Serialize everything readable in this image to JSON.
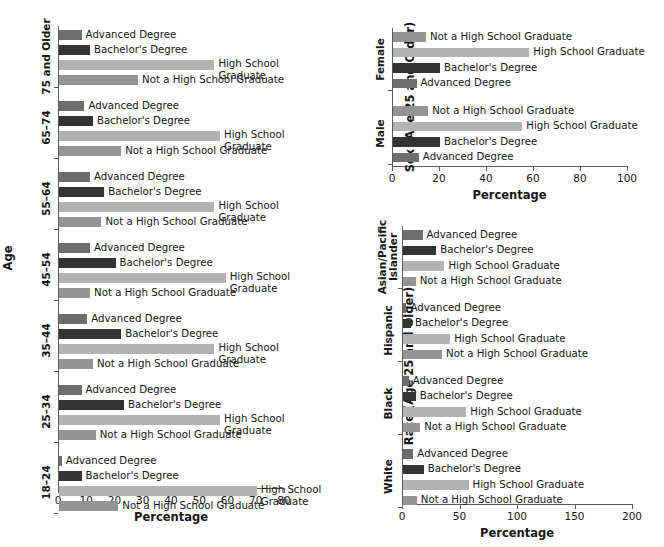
{
  "meta": {
    "categories": [
      "Advanced Degree",
      "Bachelor's Degree",
      "High School Graduate",
      "Not a High School Graduate"
    ],
    "colors": {
      "advanced_degree": "#6e6e6e",
      "bachelors_degree": "#333333",
      "high_school_graduate": "#b3b3b3",
      "not_high_school_graduate": "#949494",
      "axis": "#5a5a5a",
      "text": "#141414",
      "background": "#ffffff"
    },
    "axis_title_x": "Percentage"
  },
  "chart_data": [
    {
      "id": "age-chart",
      "type": "bar",
      "orientation": "horizontal",
      "title": "",
      "xlabel": "Percentage",
      "ylabel": "Age",
      "xlim": [
        0,
        80
      ],
      "xticks": [
        0,
        10,
        20,
        30,
        40,
        50,
        60,
        70,
        80
      ],
      "xticklabels": [
        "0",
        "10",
        "20",
        "30",
        "40",
        "50",
        "60",
        "70",
        "80"
      ],
      "grid": false,
      "legend": "inline-bar-labels",
      "groups": [
        {
          "label": "75 and Older",
          "bars": [
            {
              "name": "Advanced Degree",
              "value": 8
            },
            {
              "name": "Bachelor's Degree",
              "value": 11
            },
            {
              "name": "High School\nGraduate",
              "value": 55
            },
            {
              "name": "Not a High School Graduate",
              "value": 28
            }
          ]
        },
        {
          "label": "65–74",
          "bars": [
            {
              "name": "Advanced Degree",
              "value": 9
            },
            {
              "name": "Bachelor's Degree",
              "value": 12
            },
            {
              "name": "High School\nGraduate",
              "value": 57
            },
            {
              "name": "Not a High School Graduate",
              "value": 22
            }
          ]
        },
        {
          "label": "55–64",
          "bars": [
            {
              "name": "Advanced Degree",
              "value": 11
            },
            {
              "name": "Bachelor's Degree",
              "value": 16
            },
            {
              "name": "High School\nGraduate",
              "value": 55
            },
            {
              "name": "Not a High School Graduate",
              "value": 15
            }
          ]
        },
        {
          "label": "45–54",
          "bars": [
            {
              "name": "Advanced Degree",
              "value": 11
            },
            {
              "name": "Bachelor's Degree",
              "value": 20
            },
            {
              "name": "High School\nGraduate",
              "value": 59
            },
            {
              "name": "Not a High School Graduate",
              "value": 11
            }
          ]
        },
        {
          "label": "35–44",
          "bars": [
            {
              "name": "Advanced Degree",
              "value": 10
            },
            {
              "name": "Bachelor's Degree",
              "value": 22
            },
            {
              "name": "High School\nGraduate",
              "value": 55
            },
            {
              "name": "Not a High School Graduate",
              "value": 12
            }
          ]
        },
        {
          "label": "25–34",
          "bars": [
            {
              "name": "Advanced Degree",
              "value": 8
            },
            {
              "name": "Bachelor's Degree",
              "value": 23
            },
            {
              "name": "High School\nGraduate",
              "value": 57
            },
            {
              "name": "Not a High School Graduate",
              "value": 13
            }
          ]
        },
        {
          "label": "18–24",
          "bars": [
            {
              "name": "Advanced Degree",
              "value": 1
            },
            {
              "name": "Bachelor's Degree",
              "value": 8
            },
            {
              "name": "High School\nGraduate",
              "value": 70
            },
            {
              "name": "Not a High School Graduate",
              "value": 21
            }
          ]
        }
      ]
    },
    {
      "id": "sex-chart",
      "type": "bar",
      "orientation": "horizontal",
      "title": "",
      "xlabel": "Percentage",
      "ylabel": "Sex (Age 25 and Older)",
      "xlim": [
        0,
        100
      ],
      "xticks": [
        0,
        20,
        40,
        60,
        80,
        100
      ],
      "xticklabels": [
        "0",
        "20",
        "40",
        "60",
        "80",
        "100"
      ],
      "grid": false,
      "legend": "inline-bar-labels",
      "groups": [
        {
          "label": "Female",
          "bars": [
            {
              "name": "Not a High School Graduate",
              "value": 14
            },
            {
              "name": "High School Graduate",
              "value": 58
            },
            {
              "name": "Bachelor's Degree",
              "value": 20
            },
            {
              "name": "Advanced Degree",
              "value": 10
            }
          ]
        },
        {
          "label": "Male",
          "bars": [
            {
              "name": "Not a High School Graduate",
              "value": 15
            },
            {
              "name": "High School Graduate",
              "value": 55
            },
            {
              "name": "Bachelor's Degree",
              "value": 20
            },
            {
              "name": "Advanced Degree",
              "value": 11
            }
          ]
        }
      ]
    },
    {
      "id": "race-chart",
      "type": "bar",
      "orientation": "horizontal",
      "title": "",
      "xlabel": "Percentage",
      "ylabel": "Race (Age 25 and Older)",
      "xlim": [
        0,
        200
      ],
      "xticks": [
        0,
        50,
        100,
        150,
        200
      ],
      "xticklabels": [
        "0",
        "50",
        "100",
        "150",
        "200"
      ],
      "grid": false,
      "legend": "inline-bar-labels",
      "groups": [
        {
          "label": "Asian/Pacific\nIslander",
          "bars": [
            {
              "name": "Advanced Degree",
              "value": 17
            },
            {
              "name": "Bachelor's Degree",
              "value": 29
            },
            {
              "name": "High School Graduate",
              "value": 36
            },
            {
              "name": "Not a High School Graduate",
              "value": 11
            }
          ]
        },
        {
          "label": "Hispanic",
          "bars": [
            {
              "name": "Advanced Degree",
              "value": 3
            },
            {
              "name": "Bachelor's Degree",
              "value": 7
            },
            {
              "name": "High School Graduate",
              "value": 41
            },
            {
              "name": "Not a High School Graduate",
              "value": 34
            }
          ]
        },
        {
          "label": "Black",
          "bars": [
            {
              "name": "Advanced Degree",
              "value": 5
            },
            {
              "name": "Bachelor's Degree",
              "value": 11
            },
            {
              "name": "High School Graduate",
              "value": 55
            },
            {
              "name": "Not a High School Graduate",
              "value": 15
            }
          ]
        },
        {
          "label": "White",
          "bars": [
            {
              "name": "Advanced Degree",
              "value": 9
            },
            {
              "name": "Bachelor's Degree",
              "value": 18
            },
            {
              "name": "High School Graduate",
              "value": 57
            },
            {
              "name": "Not a High School Graduate",
              "value": 12
            }
          ]
        }
      ]
    }
  ]
}
